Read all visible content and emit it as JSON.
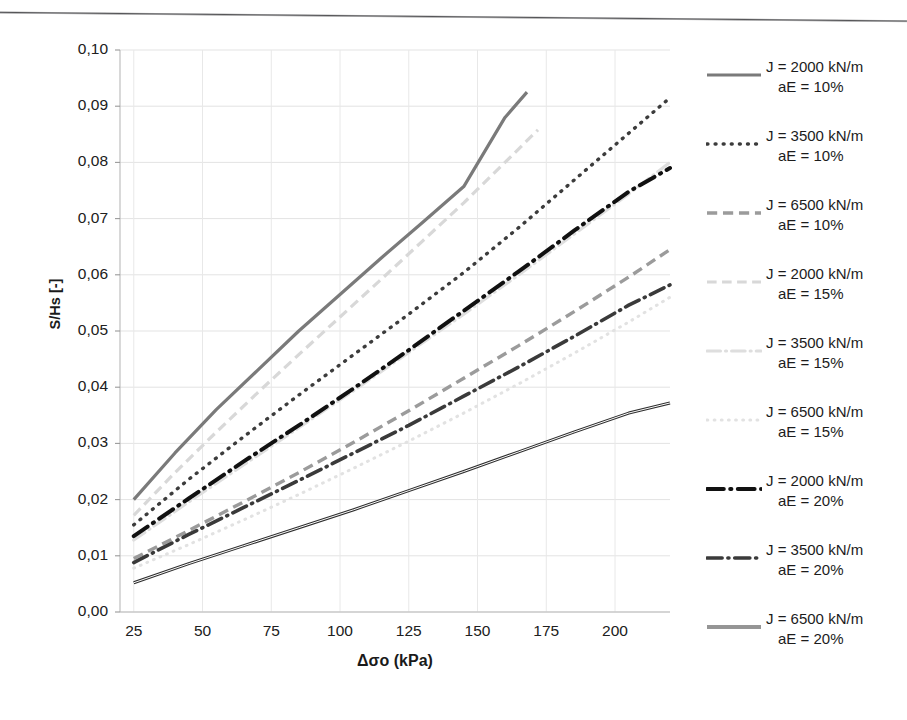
{
  "chart_data": {
    "type": "line",
    "title": "",
    "xlabel": "Δσo (kPa)",
    "ylabel": "S/Hs [-]",
    "xlim": [
      20,
      220
    ],
    "ylim": [
      0.0,
      0.1
    ],
    "xticks": [
      "25",
      "50",
      "75",
      "100",
      "125",
      "150",
      "175",
      "200"
    ],
    "xtick_values": [
      25,
      50,
      75,
      100,
      125,
      150,
      175,
      200
    ],
    "yticks": [
      "0,00",
      "0,01",
      "0,02",
      "0,03",
      "0,04",
      "0,05",
      "0,06",
      "0,07",
      "0,08",
      "0,09",
      "0,10"
    ],
    "ytick_values": [
      0.0,
      0.01,
      0.02,
      0.03,
      0.04,
      0.05,
      0.06,
      0.07,
      0.08,
      0.09,
      0.1
    ],
    "grid": true,
    "legend_position": "right",
    "decimal_separator": "comma",
    "series": [
      {
        "name": "J = 2000 kN/m\naE = 10%",
        "label_line1": "J = 2000 kN/m",
        "label_line2": "aE = 10%",
        "style": "solid",
        "color": "#7a7a7a",
        "width": 3.2,
        "x": [
          25,
          40,
          55,
          70,
          85,
          100,
          115,
          130,
          145,
          160,
          168
        ],
        "y": [
          0.02,
          0.0283,
          0.036,
          0.043,
          0.05,
          0.0565,
          0.063,
          0.0693,
          0.0757,
          0.088,
          0.0925
        ]
      },
      {
        "name": "J = 3500 kN/m\naE = 10%",
        "label_line1": "J = 3500 kN/m",
        "label_line2": "aE = 10%",
        "style": "dotted",
        "color": "#3c3c3c",
        "width": 3.4,
        "x": [
          25,
          45,
          65,
          85,
          105,
          125,
          145,
          165,
          185,
          205,
          220
        ],
        "y": [
          0.0155,
          0.0236,
          0.0312,
          0.0386,
          0.0458,
          0.053,
          0.0604,
          0.0684,
          0.0768,
          0.0852,
          0.0915
        ]
      },
      {
        "name": "J = 6500 kN/m\naE = 10%",
        "label_line1": "J = 6500 kN/m",
        "label_line2": "aE = 10%",
        "style": "dashed",
        "color": "#9b9b9b",
        "width": 3.4,
        "x": [
          25,
          45,
          65,
          85,
          105,
          125,
          145,
          165,
          185,
          205,
          220
        ],
        "y": [
          0.0095,
          0.0145,
          0.0196,
          0.0248,
          0.0302,
          0.0358,
          0.0416,
          0.0474,
          0.0534,
          0.0596,
          0.0645
        ]
      },
      {
        "name": "J = 2000 kN/m\naE = 15%",
        "label_line1": "J = 2000 kN/m",
        "label_line2": "aE = 15%",
        "style": "dashed-light",
        "color": "#d8d8d8",
        "width": 3.2,
        "x": [
          25,
          40,
          55,
          70,
          85,
          100,
          115,
          130,
          145,
          160,
          172
        ],
        "y": [
          0.0172,
          0.0248,
          0.032,
          0.039,
          0.0458,
          0.0525,
          0.0592,
          0.066,
          0.0728,
          0.08,
          0.0858
        ]
      },
      {
        "name": "J = 3500 kN/m\naE = 15%",
        "label_line1": "J = 3500 kN/m",
        "label_line2": "aE = 15%",
        "style": "dashdot-light",
        "color": "#dedede",
        "width": 3.2,
        "x": [
          25,
          45,
          65,
          85,
          105,
          125,
          145,
          165,
          185,
          205,
          220
        ],
        "y": [
          0.0128,
          0.0196,
          0.0262,
          0.0328,
          0.0394,
          0.0462,
          0.053,
          0.06,
          0.0672,
          0.0744,
          0.08
        ]
      },
      {
        "name": "J = 6500 kN/m\naE = 15%",
        "label_line1": "J = 6500 kN/m",
        "label_line2": "aE = 15%",
        "style": "dotted-light",
        "color": "#e2e2e2",
        "width": 3.0,
        "x": [
          25,
          45,
          65,
          85,
          105,
          125,
          145,
          165,
          185,
          205,
          220
        ],
        "y": [
          0.0078,
          0.012,
          0.0164,
          0.0209,
          0.0256,
          0.0304,
          0.0354,
          0.0406,
          0.046,
          0.0516,
          0.056
        ]
      },
      {
        "name": "J = 2000 kN/m\naE = 20%",
        "label_line1": "J = 2000 kN/m",
        "label_line2": "aE = 20%",
        "style": "dashdot",
        "color": "#111111",
        "width": 4.0,
        "x": [
          25,
          45,
          65,
          85,
          105,
          125,
          145,
          165,
          185,
          205,
          220
        ],
        "y": [
          0.0135,
          0.0202,
          0.0268,
          0.0332,
          0.0398,
          0.0466,
          0.0536,
          0.0606,
          0.0678,
          0.0748,
          0.079
        ]
      },
      {
        "name": "J = 3500 kN/m\naE = 20%",
        "label_line1": "J = 3500 kN/m",
        "label_line2": "aE = 20%",
        "style": "dashdot",
        "color": "#3a3a3a",
        "width": 3.6,
        "x": [
          25,
          45,
          65,
          85,
          105,
          125,
          145,
          165,
          185,
          205,
          220
        ],
        "y": [
          0.0088,
          0.0138,
          0.0186,
          0.0234,
          0.0283,
          0.0332,
          0.0384,
          0.0436,
          0.049,
          0.0546,
          0.0582
        ]
      },
      {
        "name": "J = 6500 kN/m\naE = 20%",
        "label_line1": "J = 6500 kN/m",
        "label_line2": "aE = 20%",
        "style": "solid-double",
        "color": "#2e2e2e",
        "width": 3.0,
        "x": [
          25,
          45,
          65,
          85,
          105,
          125,
          145,
          165,
          185,
          205,
          220
        ],
        "y": [
          0.0052,
          0.0086,
          0.0118,
          0.015,
          0.0182,
          0.0216,
          0.025,
          0.0285,
          0.032,
          0.0354,
          0.0372
        ]
      }
    ]
  },
  "axis": {
    "y_title": "S/Hs [-]",
    "x_title": "Δσo (kPa)"
  }
}
